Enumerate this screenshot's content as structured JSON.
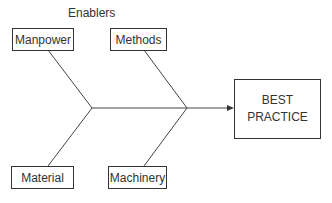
{
  "diagram": {
    "title": "Enablers",
    "causes": [
      {
        "label": "Manpower"
      },
      {
        "label": "Methods"
      },
      {
        "label": "Material"
      },
      {
        "label": "Machinery"
      }
    ],
    "effect": {
      "line1": "BEST",
      "line2": "PRACTICE"
    }
  }
}
